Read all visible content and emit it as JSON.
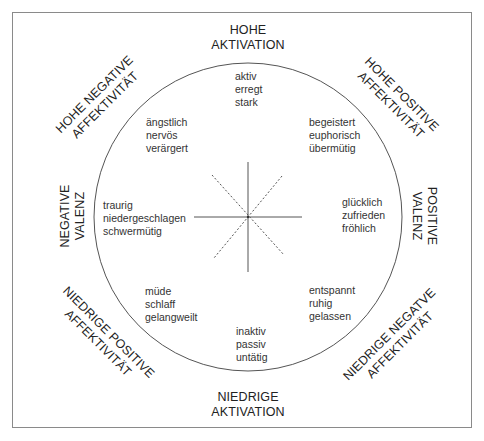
{
  "diagram": {
    "axes": {
      "top": {
        "line1": "HOHE",
        "line2": "AKTIVATION"
      },
      "bottom": {
        "line1": "NIEDRIGE",
        "line2": "AKTIVATION"
      },
      "left": {
        "line1": "NEGATIVE",
        "line2": "VALENZ"
      },
      "right": {
        "line1": "POSITIVE",
        "line2": "VALENZ"
      }
    },
    "diagonals": {
      "top_left": {
        "line1": "HOHE NEGATIVE",
        "line2": "AFFEKTIVITÄT"
      },
      "top_right": {
        "line1": "HOHE POSITIVE",
        "line2": "AFFEKTIVITÄT"
      },
      "bottom_left": {
        "line1": "NIEDRIGE POSITIVE",
        "line2": "AFFEKTIVITÄT"
      },
      "bottom_right": {
        "line1": "NIEDRIGE NEGATVE",
        "line2": "AFFEKTIVITÄT"
      }
    },
    "word_groups": {
      "n": [
        "aktiv",
        "erregt",
        "stark"
      ],
      "ne": [
        "begeistert",
        "euphorisch",
        "übermütig"
      ],
      "e": [
        "glücklich",
        "zufrieden",
        "fröhlich"
      ],
      "se": [
        "entspannt",
        "ruhig",
        "gelassen"
      ],
      "s": [
        "inaktiv",
        "passiv",
        "untätig"
      ],
      "sw": [
        "müde",
        "schlaff",
        "gelangweilt"
      ],
      "w": [
        "traurig",
        "niedergeschlagen",
        "schwermütig"
      ],
      "nw": [
        "ängstlich",
        "nervös",
        "verärgert"
      ]
    },
    "colors": {
      "line": "#555555",
      "frame": "#8a8a8a",
      "text": "#222222"
    }
  }
}
